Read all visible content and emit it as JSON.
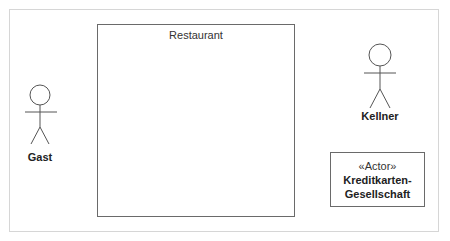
{
  "diagram": {
    "type": "UML use case diagram",
    "system_boundary": {
      "title": "Restaurant"
    },
    "actors": [
      {
        "name": "Gast",
        "kind": "stick-figure"
      },
      {
        "name": "Kellner",
        "kind": "stick-figure"
      },
      {
        "name_line1": "Kreditkarten-",
        "name_line2": "Gesellschaft",
        "stereotype": "«Actor»",
        "kind": "box"
      }
    ],
    "colors": {
      "line": "#6a6a6a",
      "frame": "#d6d6d6",
      "text": "#222222"
    }
  }
}
